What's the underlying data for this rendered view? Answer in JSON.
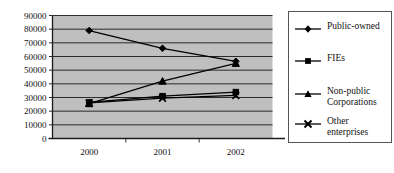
{
  "chart_data": {
    "type": "line",
    "title": "",
    "xlabel": "",
    "ylabel": "",
    "categories": [
      "2000",
      "2001",
      "2002"
    ],
    "ylim": [
      0,
      90000
    ],
    "ytick_labels": [
      "90000",
      "80000",
      "70000",
      "60000",
      "50000",
      "40000",
      "30000",
      "20000",
      "10000",
      "0"
    ],
    "ytick_values": [
      90000,
      80000,
      70000,
      60000,
      50000,
      40000,
      30000,
      20000,
      10000,
      0
    ],
    "grid": true,
    "plot_background": "#bfbfbf",
    "legend_position": "right",
    "series": [
      {
        "name": "Public-owned",
        "marker": "diamond",
        "color": "#000000",
        "values": [
          79000,
          66000,
          56500
        ]
      },
      {
        "name": "FIEs",
        "marker": "square",
        "color": "#000000",
        "values": [
          26500,
          31000,
          34000
        ]
      },
      {
        "name": "Non-public Corporations",
        "marker": "triangle",
        "color": "#000000",
        "values": [
          25500,
          42000,
          55000
        ]
      },
      {
        "name": "Other enterprises",
        "marker": "x",
        "color": "#000000",
        "values": [
          26000,
          29500,
          31500
        ]
      }
    ]
  },
  "legend": {
    "entries": [
      {
        "label": "Public-owned",
        "marker": "diamond"
      },
      {
        "label": "FIEs",
        "marker": "square"
      },
      {
        "label": "Non-public\nCorporations",
        "marker": "triangle"
      },
      {
        "label": "Other\nenterprises",
        "marker": "x"
      }
    ]
  }
}
